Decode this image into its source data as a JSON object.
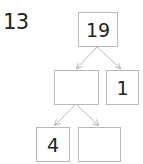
{
  "question_number": "13",
  "diagram": {
    "type": "number-bond-tree",
    "nodes": {
      "root": {
        "value": "19"
      },
      "middle_left": {
        "value": ""
      },
      "middle_right": {
        "value": "1"
      },
      "bottom_left": {
        "value": "4"
      },
      "bottom_right": {
        "value": ""
      }
    },
    "edges": [
      [
        "root",
        "middle_left"
      ],
      [
        "root",
        "middle_right"
      ],
      [
        "middle_left",
        "bottom_left"
      ],
      [
        "middle_left",
        "bottom_right"
      ]
    ],
    "colors": {
      "box_border": "#b9b9b9",
      "arrow": "#b9b9b9",
      "text": "#222222"
    }
  }
}
